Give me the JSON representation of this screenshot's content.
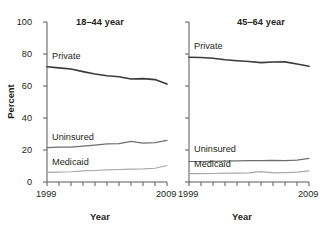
{
  "figure": {
    "background": "#ffffff",
    "axis_color": "#58595b",
    "text_color": "#231f20"
  },
  "chart_data": [
    {
      "type": "line",
      "title": "18–44 year",
      "xlabel": "Year",
      "ylabel": "Percent",
      "xlim": [
        1999,
        2009
      ],
      "ylim": [
        0,
        100
      ],
      "grid": false,
      "legend": "inline-labels",
      "xticks": [
        1999,
        2000,
        2001,
        2002,
        2003,
        2004,
        2005,
        2006,
        2007,
        2008,
        2009
      ],
      "xtick_labels_shown": [
        "1999",
        "2009"
      ],
      "yticks": [
        0,
        20,
        40,
        60,
        80,
        100
      ],
      "ytick_labels": [
        "0",
        "20",
        "40",
        "60",
        "80",
        "100"
      ],
      "x": [
        1999,
        2000,
        2001,
        2002,
        2003,
        2004,
        2005,
        2006,
        2007,
        2008,
        2009
      ],
      "series": [
        {
          "name": "Private",
          "color": "#3b3b3b",
          "width": 1.6,
          "values": [
            72.0,
            71.3,
            70.6,
            69.0,
            67.5,
            66.4,
            65.8,
            64.4,
            64.6,
            64.0,
            61.2
          ]
        },
        {
          "name": "Uninsured",
          "color": "#6d6e71",
          "width": 1.2,
          "values": [
            21.5,
            21.8,
            21.8,
            22.4,
            23.1,
            23.8,
            24.0,
            25.4,
            24.3,
            24.6,
            26.0
          ]
        },
        {
          "name": "Medicaid",
          "color": "#a7a9ac",
          "width": 1.2,
          "values": [
            6.0,
            6.2,
            6.4,
            6.9,
            7.2,
            7.6,
            7.8,
            8.0,
            8.2,
            8.6,
            10.3
          ]
        }
      ]
    },
    {
      "type": "line",
      "title": "45–64 year",
      "xlabel": "Year",
      "ylabel": "",
      "xlim": [
        1999,
        2009
      ],
      "ylim": [
        0,
        100
      ],
      "grid": false,
      "legend": "inline-labels",
      "xticks": [
        1999,
        2000,
        2001,
        2002,
        2003,
        2004,
        2005,
        2006,
        2007,
        2008,
        2009
      ],
      "xtick_labels_shown": [
        "1999",
        "2009"
      ],
      "yticks": [
        0,
        20,
        40,
        60,
        80,
        100
      ],
      "ytick_labels": [],
      "x": [
        1999,
        2000,
        2001,
        2002,
        2003,
        2004,
        2005,
        2006,
        2007,
        2008,
        2009
      ],
      "series": [
        {
          "name": "Private",
          "color": "#3b3b3b",
          "width": 1.6,
          "values": [
            78.0,
            77.8,
            77.3,
            76.4,
            75.8,
            75.3,
            74.6,
            75.0,
            75.1,
            73.8,
            72.3
          ]
        },
        {
          "name": "Uninsured",
          "color": "#6d6e71",
          "width": 1.2,
          "values": [
            12.8,
            12.8,
            12.9,
            13.1,
            13.2,
            13.3,
            13.4,
            13.5,
            13.4,
            13.7,
            14.8
          ]
        },
        {
          "name": "Medicaid",
          "color": "#a7a9ac",
          "width": 1.2,
          "values": [
            5.2,
            5.2,
            5.3,
            5.5,
            5.6,
            5.7,
            6.5,
            5.7,
            5.9,
            6.2,
            7.0
          ]
        }
      ]
    }
  ],
  "panels": [
    {
      "id": "left",
      "title": "18–44 year",
      "ylabel": "Percent",
      "xlabel": "Year",
      "xtick_start": "1999",
      "xtick_end": "2009",
      "ytick_labels": [
        "100",
        "80",
        "60",
        "40",
        "20",
        "0"
      ],
      "series_labels": [
        "Private",
        "Uninsured",
        "Medicaid"
      ]
    },
    {
      "id": "right",
      "title": "45–64 year",
      "ylabel": "",
      "xlabel": "Year",
      "xtick_start": "1999",
      "xtick_end": "2009",
      "ytick_labels": [],
      "series_labels": [
        "Private",
        "Uninsured",
        "Medicaid"
      ]
    }
  ]
}
